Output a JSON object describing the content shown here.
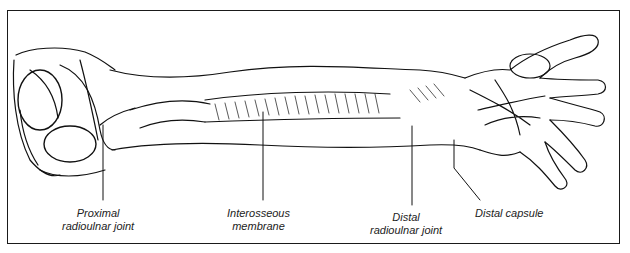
{
  "figure": {
    "labels": [
      {
        "id": "proximal",
        "line1": "Proximal",
        "line2": "radioulnar joint"
      },
      {
        "id": "interosseous",
        "line1": "Interosseous",
        "line2": "membrane"
      },
      {
        "id": "distal",
        "line1": "Distal",
        "line2": "radioulnar joint"
      },
      {
        "id": "capsule",
        "line1": "Distal capsule",
        "line2": ""
      }
    ]
  }
}
